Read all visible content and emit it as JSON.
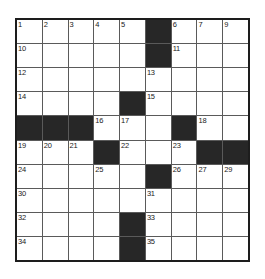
{
  "puzzle": {
    "title": "Crossword Grid",
    "rows": 9,
    "columns": 9,
    "colors": {
      "block": "#272727",
      "cell": "#ffffff",
      "gridline": "#5a5a5a",
      "border": "#1d1d1d",
      "number": "#1a1a1a",
      "page_background": "#ffffff"
    },
    "legend": {
      "block_symbol": "filled-black-square",
      "cell_symbol": "empty-white-square"
    },
    "numbers_in_order": [
      1,
      2,
      3,
      4,
      5,
      6,
      7,
      8,
      9,
      10,
      11,
      12,
      13,
      14,
      15,
      16,
      17,
      18,
      19,
      20,
      21,
      22,
      23,
      24,
      25,
      26,
      27,
      28,
      29,
      30,
      31,
      32,
      33,
      34,
      35
    ],
    "grid": [
      [
        {
          "type": "cell",
          "number": "1"
        },
        {
          "type": "cell",
          "number": "2"
        },
        {
          "type": "cell",
          "number": "3"
        },
        {
          "type": "cell",
          "number": "4"
        },
        {
          "type": "cell",
          "number": "5"
        },
        {
          "type": "block",
          "number": ""
        },
        {
          "type": "cell",
          "number": "6"
        },
        {
          "type": "cell",
          "number": "7"
        },
        {
          "type": "cell",
          "number": "8"
        }
      ],
      [
        {
          "type": "cell",
          "number": "10"
        },
        {
          "type": "cell",
          "number": ""
        },
        {
          "type": "cell",
          "number": ""
        },
        {
          "type": "cell",
          "number": ""
        },
        {
          "type": "cell",
          "number": ""
        },
        {
          "type": "block",
          "number": ""
        },
        {
          "type": "cell",
          "number": "11"
        },
        {
          "type": "cell",
          "number": ""
        },
        {
          "type": "cell",
          "number": ""
        }
      ],
      [
        {
          "type": "cell",
          "number": "12"
        },
        {
          "type": "cell",
          "number": ""
        },
        {
          "type": "cell",
          "number": ""
        },
        {
          "type": "cell",
          "number": ""
        },
        {
          "type": "cell",
          "number": ""
        },
        {
          "type": "cell",
          "number": "13"
        },
        {
          "type": "cell",
          "number": ""
        },
        {
          "type": "cell",
          "number": ""
        },
        {
          "type": "cell",
          "number": ""
        }
      ],
      [
        {
          "type": "cell",
          "number": "14"
        },
        {
          "type": "cell",
          "number": ""
        },
        {
          "type": "cell",
          "number": ""
        },
        {
          "type": "cell",
          "number": ""
        },
        {
          "type": "block",
          "number": ""
        },
        {
          "type": "cell",
          "number": "15"
        },
        {
          "type": "cell",
          "number": ""
        },
        {
          "type": "cell",
          "number": ""
        },
        {
          "type": "cell",
          "number": ""
        }
      ],
      [
        {
          "type": "block",
          "number": ""
        },
        {
          "type": "block",
          "number": ""
        },
        {
          "type": "block",
          "number": ""
        },
        {
          "type": "cell",
          "number": "16"
        },
        {
          "type": "cell",
          "number": "17"
        },
        {
          "type": "cell",
          "number": ""
        },
        {
          "type": "block",
          "number": ""
        },
        {
          "type": "cell",
          "number": "18"
        },
        {
          "type": "cell",
          "number": ""
        }
      ],
      [
        {
          "type": "cell",
          "number": "19"
        },
        {
          "type": "cell",
          "number": "20"
        },
        {
          "type": "cell",
          "number": "21"
        },
        {
          "type": "block",
          "number": ""
        },
        {
          "type": "cell",
          "number": "22"
        },
        {
          "type": "cell",
          "number": ""
        },
        {
          "type": "cell",
          "number": "23"
        },
        {
          "type": "block",
          "number": ""
        },
        {
          "type": "block",
          "number": ""
        }
      ],
      [
        {
          "type": "cell",
          "number": "24"
        },
        {
          "type": "cell",
          "number": ""
        },
        {
          "type": "cell",
          "number": ""
        },
        {
          "type": "cell",
          "number": "25"
        },
        {
          "type": "cell",
          "number": ""
        },
        {
          "type": "block",
          "number": ""
        },
        {
          "type": "cell",
          "number": "26"
        },
        {
          "type": "cell",
          "number": "27"
        },
        {
          "type": "cell",
          "number": "28"
        }
      ],
      [
        {
          "type": "cell",
          "number": "30"
        },
        {
          "type": "cell",
          "number": ""
        },
        {
          "type": "cell",
          "number": ""
        },
        {
          "type": "cell",
          "number": ""
        },
        {
          "type": "cell",
          "number": ""
        },
        {
          "type": "cell",
          "number": "31"
        },
        {
          "type": "cell",
          "number": ""
        },
        {
          "type": "cell",
          "number": ""
        },
        {
          "type": "cell",
          "number": ""
        }
      ],
      [
        {
          "type": "cell",
          "number": "32"
        },
        {
          "type": "cell",
          "number": ""
        },
        {
          "type": "cell",
          "number": ""
        },
        {
          "type": "cell",
          "number": ""
        },
        {
          "type": "block",
          "number": ""
        },
        {
          "type": "cell",
          "number": "33"
        },
        {
          "type": "cell",
          "number": ""
        },
        {
          "type": "cell",
          "number": ""
        },
        {
          "type": "cell",
          "number": ""
        }
      ]
    ],
    "extra_row_numbers": {
      "row1_col9": "9",
      "row7_col9": "29",
      "row10_col1": "34",
      "row10_col6": "35"
    }
  }
}
